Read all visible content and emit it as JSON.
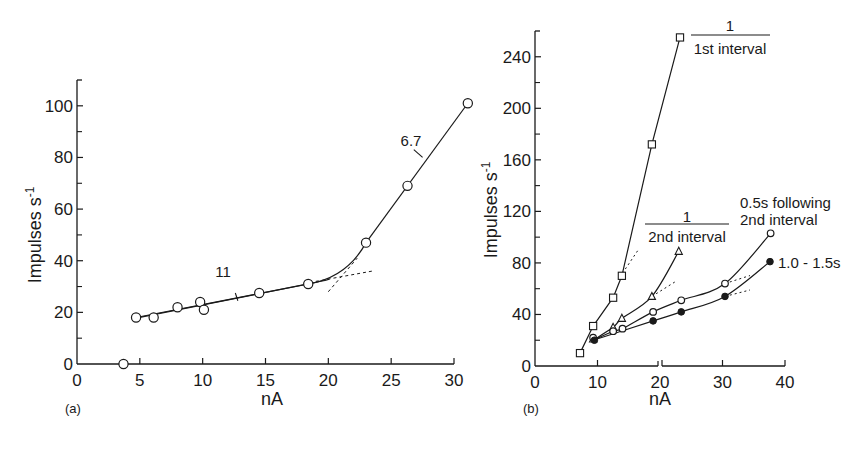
{
  "chart_data": [
    {
      "panel": "(a)",
      "type": "line",
      "title": "",
      "xlabel": "nA",
      "ylabel": "Impulses s⁻¹",
      "xlim": [
        0,
        30
      ],
      "ylim": [
        0,
        110
      ],
      "xticks": [
        0,
        5,
        10,
        15,
        20,
        25,
        30
      ],
      "yticks": [
        0,
        20,
        40,
        60,
        80,
        100
      ],
      "y_minor_ticks": [
        10,
        30,
        50,
        70,
        90,
        110
      ],
      "grid": false,
      "series": [
        {
          "name": "open circles",
          "marker": "open-circle",
          "points": [
            [
              3.7,
              0
            ],
            [
              4.7,
              18
            ],
            [
              6.1,
              18
            ],
            [
              8.0,
              22
            ],
            [
              9.8,
              24
            ],
            [
              10.1,
              21
            ],
            [
              14.5,
              27.5
            ],
            [
              18.4,
              31
            ],
            [
              23.0,
              47
            ],
            [
              26.3,
              69
            ],
            [
              31.1,
              101
            ]
          ]
        }
      ],
      "fit_lines": [
        {
          "label": "11",
          "from": [
            4.7,
            18
          ],
          "to": [
            19.5,
            32.5
          ],
          "style": "solid"
        },
        {
          "label": "6.7",
          "from": [
            22.0,
            40
          ],
          "to": [
            31.1,
            101
          ],
          "style": "solid"
        }
      ],
      "annotations": [
        {
          "text": "11",
          "at": [
            12.7,
            25.5
          ]
        },
        {
          "text": "6.7",
          "at": [
            27.4,
            83
          ]
        }
      ]
    },
    {
      "panel": "(b)",
      "type": "line",
      "title": "",
      "xlabel": "nA",
      "ylabel": "Impulses s⁻¹",
      "xlim": [
        0,
        40
      ],
      "ylim": [
        0,
        260
      ],
      "xticks": [
        0,
        10,
        20,
        30,
        40
      ],
      "yticks": [
        0,
        40,
        80,
        120,
        160,
        200,
        240
      ],
      "y_minor_ticks": [
        20,
        60,
        100,
        140,
        180,
        220,
        260
      ],
      "grid": false,
      "series": [
        {
          "name": "1 / 1st interval",
          "marker": "open-square",
          "points": [
            [
              7.2,
              10
            ],
            [
              9.3,
              31
            ],
            [
              12.5,
              53
            ],
            [
              13.9,
              70
            ],
            [
              18.7,
              172
            ],
            [
              23.2,
              255
            ]
          ]
        },
        {
          "name": "1 / 2nd interval",
          "marker": "open-triangle",
          "points": [
            [
              9.3,
              21
            ],
            [
              12.5,
              30
            ],
            [
              13.9,
              37
            ],
            [
              18.7,
              54
            ],
            [
              23.0,
              89
            ]
          ]
        },
        {
          "name": "0.5s following 2nd interval",
          "marker": "open-circle",
          "points": [
            [
              9.3,
              22
            ],
            [
              12.5,
              27
            ],
            [
              14.0,
              29
            ],
            [
              18.9,
              42
            ],
            [
              23.4,
              51
            ],
            [
              30.4,
              64
            ],
            [
              37.7,
              103
            ]
          ]
        },
        {
          "name": "1.0 - 1.5s",
          "marker": "filled-circle",
          "points": [
            [
              9.5,
              20
            ],
            [
              18.9,
              35
            ],
            [
              23.4,
              42
            ],
            [
              30.4,
              54
            ],
            [
              37.6,
              81
            ]
          ]
        }
      ],
      "legend_labels": {
        "first_numerator": "1",
        "first_denominator": "1st interval",
        "second_numerator": "1",
        "second_denominator": "2nd interval",
        "third_line1": "0.5s following",
        "third_line2": "2nd interval",
        "fourth": "1.0 - 1.5s"
      }
    }
  ],
  "panels": {
    "a": {
      "label": "(a)",
      "xlabel": "nA",
      "ylabel_main": "Impulses  s",
      "ylabel_sup": "-1",
      "slope1": "11",
      "slope2": "6.7"
    },
    "b": {
      "label": "(b)",
      "xlabel": "nA",
      "ylabel_main": "Impulses  s",
      "ylabel_sup": "-1"
    }
  }
}
